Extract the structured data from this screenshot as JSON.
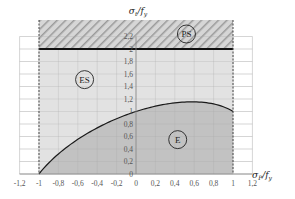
{
  "chart_data": {
    "type": "area",
    "title": "",
    "xlabel": "σP/fy",
    "ylabel": "σt/fy",
    "xlim": [
      -1.2,
      1.2
    ],
    "ylim": [
      0,
      2.3
    ],
    "x_ticks": [
      "-1,2",
      "-1",
      "-0,8",
      "-0,6",
      "-0,4",
      "-0,2",
      "0",
      "0,2",
      "0,4",
      "0,6",
      "0,8",
      "1",
      "1,2"
    ],
    "x_tick_values": [
      -1.2,
      -1,
      -0.8,
      -0.6,
      -0.4,
      -0.2,
      0,
      0.2,
      0.4,
      0.6,
      0.8,
      1,
      1.2
    ],
    "y_ticks": [
      "0",
      "0,2",
      "0,4",
      "0,6",
      "0,8",
      "1",
      "1,2",
      "1,4",
      "1,6",
      "1,8",
      "2",
      "2,2"
    ],
    "y_tick_values": [
      0,
      0.2,
      0.4,
      0.6,
      0.8,
      1.0,
      1.2,
      1.4,
      1.6,
      1.8,
      2.0,
      2.2
    ],
    "grid": true,
    "legend": "none",
    "series": [
      {
        "name": "elastic limit curve",
        "x": [
          -1,
          -0.9,
          -0.8,
          -0.7,
          -0.6,
          -0.5,
          -0.4,
          -0.3,
          -0.2,
          -0.1,
          0,
          0.1,
          0.2,
          0.3,
          0.4,
          0.5,
          0.577,
          0.6,
          0.7,
          0.8,
          0.9,
          1
        ],
        "y": [
          0,
          0.18,
          0.32,
          0.44,
          0.55,
          0.65,
          0.74,
          0.81,
          0.88,
          0.94,
          1.0,
          1.05,
          1.08,
          1.11,
          1.14,
          1.15,
          1.155,
          1.15,
          1.14,
          1.12,
          1.07,
          1.0
        ],
        "color": "#1a1a1a"
      },
      {
        "name": "plastic limit line",
        "x": [
          -1,
          1
        ],
        "y": [
          2.0,
          2.0
        ],
        "color": "#111111"
      }
    ],
    "regions": [
      {
        "label": "E",
        "description": "below curve",
        "fill": "#c2c2c2",
        "label_pos": [
          0.43,
          0.55
        ]
      },
      {
        "label": "ES",
        "description": "between curve and 2.0",
        "fill": "#e2e2e2",
        "label_pos": [
          -0.53,
          1.51
        ]
      },
      {
        "label": "PS",
        "description": "hatched above 2.0",
        "fill": "hatch",
        "label_pos": [
          0.52,
          2.24
        ]
      }
    ],
    "boundaries": {
      "x_min": -1,
      "x_max": 1,
      "style": "dashed"
    }
  },
  "colors": {
    "region_e": "#c2c2c2",
    "region_es": "#e2e2e2",
    "hatch_bg": "#d6d6d6",
    "hatch_line": "#9a9a9a",
    "grid": "#b8b8b8",
    "curve": "#1a1a1a"
  }
}
